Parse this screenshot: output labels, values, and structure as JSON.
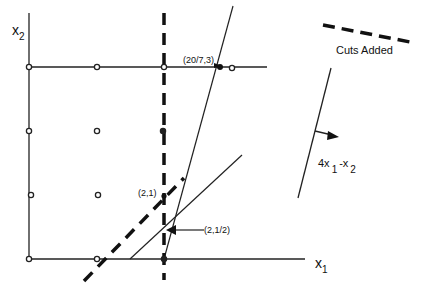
{
  "diagram": {
    "axes": {
      "x_label": "x",
      "x_sub": "1",
      "y_label": "x",
      "y_sub": "2"
    },
    "legend": {
      "label": "Cuts Added",
      "style": "dashed"
    },
    "objective": {
      "prefix": "4x",
      "sub1": "1",
      "mid": "-x",
      "sub2": "2",
      "direction": "right"
    },
    "points": {
      "lp_optimum": "(20/7,3)",
      "cut_point_a": "(2,1)",
      "cut_point_b": "(2,1/2)"
    },
    "integer_points": [
      {
        "x": 0,
        "y": 0
      },
      {
        "x": 1,
        "y": 0
      },
      {
        "x": 2,
        "y": 0
      },
      {
        "x": 0,
        "y": 1
      },
      {
        "x": 1,
        "y": 1
      },
      {
        "x": 2,
        "y": 1
      },
      {
        "x": 0,
        "y": 2
      },
      {
        "x": 1,
        "y": 2
      },
      {
        "x": 2,
        "y": 2
      },
      {
        "x": 0,
        "y": 3
      },
      {
        "x": 1,
        "y": 3
      },
      {
        "x": 2,
        "y": 3
      },
      {
        "x": 3,
        "y": 3
      }
    ],
    "constraints": [
      {
        "name": "x2 <= 3",
        "style": "solid"
      },
      {
        "name": "steep constraint",
        "style": "solid"
      },
      {
        "name": "shallow constraint",
        "style": "solid"
      },
      {
        "name": "cut x1 <= 2",
        "style": "dashed"
      },
      {
        "name": "cut x1 - x2 <= 1",
        "style": "dashed"
      }
    ],
    "colors": {
      "ink": "#111111",
      "background": "#ffffff"
    }
  }
}
